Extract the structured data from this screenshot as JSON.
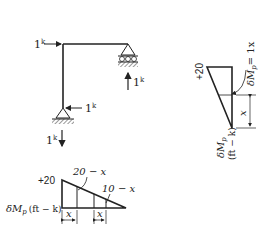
{
  "frame": {
    "loads": {
      "top_left_horizontal": "1",
      "top_left_unit": "k",
      "right_support_reaction": "1",
      "right_support_unit": "k",
      "left_support_horizontal": "1",
      "left_support_horizontal_unit": "k",
      "left_support_vertical": "1",
      "left_support_vertical_unit": "k"
    }
  },
  "right_diagram": {
    "top_value": "+20",
    "moment_label": "δM",
    "moment_sub": "p",
    "equation": "= 1x",
    "dimension": "x",
    "axis_label_main": "δM",
    "axis_label_sub": "p",
    "axis_units": "(ft − k)"
  },
  "bottom_diagram": {
    "top_value": "+20",
    "label_left": "20 − x",
    "label_right": "10 − x",
    "axis_label_main": "δM",
    "axis_label_sub": "p",
    "axis_units": "(ft − k)",
    "dim_left": "x",
    "dim_right": "x"
  }
}
